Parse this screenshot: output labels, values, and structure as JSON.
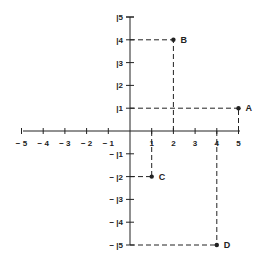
{
  "diagram": {
    "type": "coordinate-plane",
    "x_range": [
      -5,
      5
    ],
    "y_range": [
      -5,
      5
    ],
    "x_tick_labels": [
      "-5",
      "-4",
      "-3",
      "-2",
      "-1",
      "1",
      "2",
      "3",
      "4",
      "5"
    ],
    "y_tick_labels_positive": [
      "|5",
      "|4",
      "|3",
      "|2",
      "|1"
    ],
    "y_tick_labels_negative": [
      "- |1",
      "- |2",
      "- |3",
      "- |4",
      "- |5"
    ],
    "points": [
      {
        "label": "A",
        "x": 5,
        "y": 1
      },
      {
        "label": "B",
        "x": 2,
        "y": 4
      },
      {
        "label": "C",
        "x": 1,
        "y": -2
      },
      {
        "label": "D",
        "x": 4,
        "y": -5
      }
    ],
    "colors": {
      "ink": "#222222",
      "background": "#ffffff"
    }
  }
}
